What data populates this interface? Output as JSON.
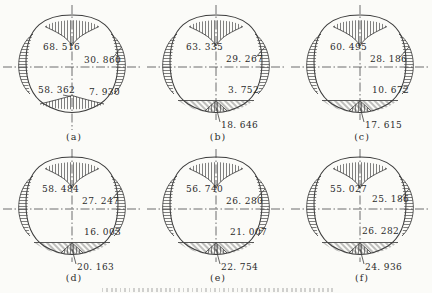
{
  "figure": {
    "description_note": "",
    "panels": [
      {
        "label": "(a)",
        "top": "68. 516",
        "right": "30. 860",
        "bottom_left": "58. 362",
        "bottom_right": "7. 930"
      },
      {
        "label": "(b)",
        "top": "63. 335",
        "right": "29. 267",
        "bottom_right": "3. 752",
        "bottom_center": "18. 646"
      },
      {
        "label": "(c)",
        "top": "60. 495",
        "right": "28. 186",
        "bottom_right": "10. 672",
        "bottom_center": "17. 615"
      },
      {
        "label": "(d)",
        "top": "58. 484",
        "right": "27. 247",
        "bottom_right": "16. 003",
        "bottom_center": "20. 163"
      },
      {
        "label": "(e)",
        "top": "56. 740",
        "right": "26. 280",
        "bottom_right": "21. 007",
        "bottom_center": "22. 754"
      },
      {
        "label": "(f)",
        "top": "55. 027",
        "right": "25. 186",
        "bottom_right": "26. 282",
        "bottom_center": "24. 936"
      }
    ]
  }
}
